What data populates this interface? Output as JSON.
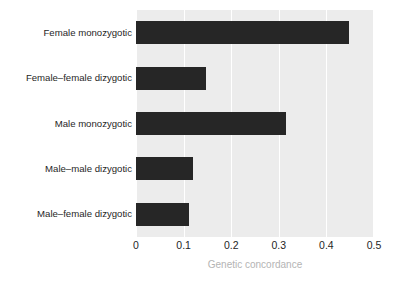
{
  "chart_data": {
    "type": "bar",
    "orientation": "horizontal",
    "title": "",
    "xlabel": "Genetic concordance",
    "ylabel": "",
    "xlim": [
      0,
      0.5
    ],
    "xticks": [
      "0",
      "0.1",
      "0.2",
      "0.3",
      "0.4",
      "0.5"
    ],
    "xtick_values": [
      0,
      0.1,
      0.2,
      0.3,
      0.4,
      0.5
    ],
    "grid": "vertical-white",
    "legend": "none",
    "categories": [
      "Female monozygotic",
      "Female–female dizygotic",
      "Male monozygotic",
      "Male–male dizygotic",
      "Male–female dizygotic"
    ],
    "values": [
      0.447,
      0.147,
      0.315,
      0.12,
      0.112
    ],
    "bar_color": "#262626",
    "panel_color": "#ececec",
    "gridline_color": "#ffffff",
    "axis_label_color": "#b4b4b4",
    "tick_label_color": "#1f1f1f"
  }
}
